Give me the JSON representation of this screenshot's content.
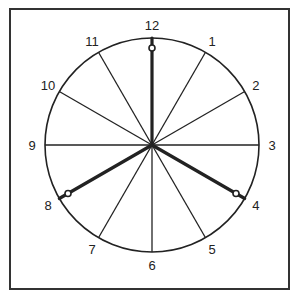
{
  "diagram": {
    "type": "clock-face",
    "numbers": [
      "12",
      "1",
      "2",
      "3",
      "4",
      "5",
      "6",
      "7",
      "8",
      "9",
      "10",
      "11"
    ],
    "hands": [
      {
        "name": "hand-12",
        "points_to": "12"
      },
      {
        "name": "hand-4",
        "points_to": "4"
      },
      {
        "name": "hand-8",
        "points_to": "8"
      }
    ],
    "colors": {
      "ink": "#222222",
      "background": "#ffffff"
    }
  }
}
